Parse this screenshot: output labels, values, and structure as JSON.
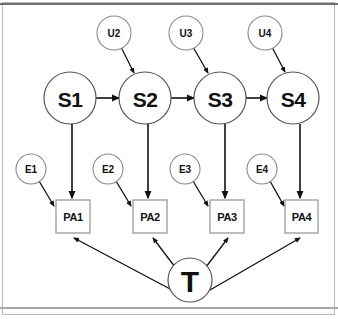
{
  "diagram": {
    "type": "path-diagram",
    "canvas": {
      "width": 338,
      "height": 319,
      "background": "#ffffff"
    },
    "colors": {
      "node_fill": "#ffffff",
      "node_stroke": "#8a8a8a",
      "box_stroke": "#9a9a9a",
      "edge": "#111111",
      "label": "#111111",
      "frame": "#b9b9b9",
      "top_rule": "#6e6e6e",
      "bottom_rule": "#a8a8a8"
    },
    "nodes": {
      "disturbances": [
        {
          "id": "U2",
          "label": "U2",
          "cx": 114,
          "cy": 33,
          "r": 17
        },
        {
          "id": "U3",
          "label": "U3",
          "cx": 186,
          "cy": 33,
          "r": 17
        },
        {
          "id": "U4",
          "label": "U4",
          "cx": 265,
          "cy": 33,
          "r": 17
        }
      ],
      "states": [
        {
          "id": "S1",
          "label": "S1",
          "cx": 70,
          "cy": 98,
          "r": 26
        },
        {
          "id": "S2",
          "label": "S2",
          "cx": 145,
          "cy": 98,
          "r": 26
        },
        {
          "id": "S3",
          "label": "S3",
          "cx": 220,
          "cy": 98,
          "r": 26
        },
        {
          "id": "S4",
          "label": "S4",
          "cx": 293,
          "cy": 98,
          "r": 26
        }
      ],
      "errors": [
        {
          "id": "E1",
          "label": "E1",
          "cx": 31,
          "cy": 169,
          "r": 15
        },
        {
          "id": "E2",
          "label": "E2",
          "cx": 108,
          "cy": 169,
          "r": 15
        },
        {
          "id": "E3",
          "label": "E3",
          "cx": 185,
          "cy": 169,
          "r": 15
        },
        {
          "id": "E4",
          "label": "E4",
          "cx": 262,
          "cy": 169,
          "r": 15
        }
      ],
      "indicators": [
        {
          "id": "PA1",
          "label": "PA1",
          "x": 56,
          "y": 200,
          "w": 34,
          "h": 33
        },
        {
          "id": "PA2",
          "label": "PA2",
          "x": 133,
          "y": 200,
          "w": 34,
          "h": 33
        },
        {
          "id": "PA3",
          "label": "PA3",
          "x": 210,
          "y": 200,
          "w": 34,
          "h": 33
        },
        {
          "id": "PA4",
          "label": "PA4",
          "x": 285,
          "y": 200,
          "w": 33,
          "h": 33
        }
      ],
      "treatment": {
        "id": "T",
        "label": "T",
        "cx": 190,
        "cy": 280,
        "r": 22
      }
    },
    "edges": [
      {
        "from": "U2",
        "to": "S2",
        "kind": "diagonal"
      },
      {
        "from": "U3",
        "to": "S3",
        "kind": "diagonal"
      },
      {
        "from": "U4",
        "to": "S4",
        "kind": "diagonal"
      },
      {
        "from": "S1",
        "to": "S2",
        "kind": "horizontal"
      },
      {
        "from": "S2",
        "to": "S3",
        "kind": "horizontal"
      },
      {
        "from": "S3",
        "to": "S4",
        "kind": "horizontal"
      },
      {
        "from": "S1",
        "to": "PA1",
        "kind": "vertical"
      },
      {
        "from": "S2",
        "to": "PA2",
        "kind": "vertical"
      },
      {
        "from": "S3",
        "to": "PA3",
        "kind": "vertical"
      },
      {
        "from": "S4",
        "to": "PA4",
        "kind": "vertical"
      },
      {
        "from": "E1",
        "to": "PA1",
        "kind": "diagonal"
      },
      {
        "from": "E2",
        "to": "PA2",
        "kind": "diagonal"
      },
      {
        "from": "E3",
        "to": "PA3",
        "kind": "diagonal"
      },
      {
        "from": "E4",
        "to": "PA4",
        "kind": "diagonal"
      },
      {
        "from": "T",
        "to": "PA1",
        "kind": "fan"
      },
      {
        "from": "T",
        "to": "PA2",
        "kind": "fan"
      },
      {
        "from": "T",
        "to": "PA3",
        "kind": "fan"
      },
      {
        "from": "T",
        "to": "PA4",
        "kind": "fan"
      }
    ]
  }
}
